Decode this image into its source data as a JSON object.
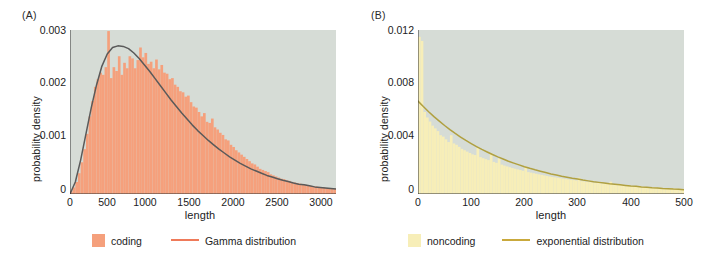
{
  "figure": {
    "background": "#ffffff",
    "plot_background": "#d6dcd6"
  },
  "panels": [
    {
      "tag": "(A)",
      "xlabel": "length",
      "ylabel": "probability density",
      "legend": {
        "hist_label": "coding",
        "curve_label": "Gamma distribution",
        "hist_color": "#f5a07c",
        "curve_color": "#ef7a5a"
      }
    },
    {
      "tag": "(B)",
      "xlabel": "length",
      "ylabel": "probability density",
      "legend": {
        "hist_label": "noncoding",
        "curve_label": "exponential distribution",
        "hist_color": "#f7eeb8",
        "curve_color": "#c9a93c"
      }
    }
  ],
  "chart_data": [
    {
      "type": "bar",
      "title": "(A)",
      "xlabel": "length",
      "ylabel": "probability density",
      "xlim": [
        0,
        3000
      ],
      "ylim": [
        0,
        0.003
      ],
      "xticks": [
        0,
        500,
        1000,
        1500,
        2000,
        2500,
        3000
      ],
      "xtick_labels": [
        "0",
        "500",
        "1000",
        "1500",
        "2000",
        "2500",
        "3000"
      ],
      "yticks": [
        0,
        0.001,
        0.002,
        0.003
      ],
      "ytick_labels": [
        "0",
        "0.001",
        "0.002",
        "0.003"
      ],
      "grid": false,
      "legend_position": "below",
      "plot_background": "#d6dcd6",
      "series": [
        {
          "name": "coding",
          "kind": "histogram",
          "color": "#f5a07c",
          "bin_width": 30,
          "bin_centers": [
            15,
            45,
            75,
            105,
            135,
            165,
            195,
            225,
            255,
            285,
            315,
            345,
            375,
            405,
            435,
            465,
            495,
            525,
            555,
            585,
            615,
            645,
            675,
            705,
            735,
            765,
            795,
            825,
            855,
            885,
            915,
            945,
            975,
            1005,
            1035,
            1065,
            1095,
            1125,
            1155,
            1185,
            1215,
            1245,
            1275,
            1305,
            1335,
            1365,
            1395,
            1425,
            1455,
            1485,
            1515,
            1545,
            1575,
            1605,
            1635,
            1665,
            1695,
            1725,
            1755,
            1785,
            1815,
            1845,
            1875,
            1905,
            1935,
            1965,
            1995,
            2025,
            2055,
            2085,
            2115,
            2145,
            2175,
            2205,
            2235,
            2265,
            2295,
            2325,
            2355,
            2385,
            2415,
            2445,
            2475,
            2505,
            2535,
            2565,
            2595,
            2625,
            2655,
            2685,
            2715,
            2745,
            2775,
            2805,
            2835,
            2865,
            2895,
            2925,
            2955,
            2985
          ],
          "values": [
            5e-05,
            0.00012,
            0.00022,
            0.00038,
            0.00058,
            0.00082,
            0.0011,
            0.00142,
            0.0017,
            0.00196,
            0.0021,
            0.00222,
            0.00218,
            0.00232,
            0.00298,
            0.00212,
            0.00232,
            0.00225,
            0.00252,
            0.00218,
            0.0024,
            0.0023,
            0.00252,
            0.00248,
            0.0023,
            0.00245,
            0.00268,
            0.0025,
            0.00258,
            0.00238,
            0.00242,
            0.0023,
            0.00246,
            0.00228,
            0.00236,
            0.00222,
            0.0022,
            0.0021,
            0.00212,
            0.002,
            0.00196,
            0.00188,
            0.00186,
            0.00178,
            0.0018,
            0.00168,
            0.0016,
            0.00158,
            0.0015,
            0.00142,
            0.00148,
            0.00132,
            0.0013,
            0.00138,
            0.00122,
            0.00118,
            0.00112,
            0.00108,
            0.001,
            0.00098,
            0.0009,
            0.00086,
            0.0008,
            0.00076,
            0.00072,
            0.00068,
            0.00064,
            0.0006,
            0.00056,
            0.00054,
            0.0005,
            0.00046,
            0.00044,
            0.00042,
            0.0004,
            0.00036,
            0.00034,
            0.00032,
            0.0003,
            0.00028,
            0.00027,
            0.00025,
            0.00024,
            0.00022,
            0.00021,
            0.0002,
            0.00019,
            0.00018,
            0.00017,
            0.00016,
            0.00015,
            0.00014,
            0.00014,
            0.00013,
            0.00012,
            0.00012,
            0.00011,
            0.00011,
            0.0001,
            0.0001
          ]
        },
        {
          "name": "Gamma distribution",
          "kind": "line",
          "color": "#5a5a5a",
          "x": [
            0,
            60,
            120,
            180,
            240,
            300,
            360,
            420,
            480,
            540,
            600,
            660,
            720,
            780,
            840,
            900,
            960,
            1020,
            1080,
            1140,
            1200,
            1260,
            1320,
            1380,
            1440,
            1500,
            1560,
            1620,
            1680,
            1740,
            1800,
            1860,
            1920,
            1980,
            2040,
            2100,
            2160,
            2220,
            2280,
            2340,
            2400,
            2460,
            2520,
            2580,
            2640,
            2700,
            2760,
            2820,
            2880,
            2940,
            3000
          ],
          "y": [
            0.0,
            0.00022,
            0.00062,
            0.0011,
            0.00158,
            0.002,
            0.00234,
            0.00256,
            0.00268,
            0.00271,
            0.0027,
            0.00266,
            0.00258,
            0.00248,
            0.00236,
            0.00224,
            0.00211,
            0.00198,
            0.00185,
            0.00172,
            0.0016,
            0.00148,
            0.00137,
            0.00126,
            0.00116,
            0.00107,
            0.00098,
            0.0009,
            0.00082,
            0.00075,
            0.00068,
            0.00062,
            0.00056,
            0.00051,
            0.00046,
            0.00042,
            0.00038,
            0.00034,
            0.00031,
            0.00028,
            0.00025,
            0.00023,
            0.0002,
            0.00018,
            0.00017,
            0.00015,
            0.00013,
            0.00012,
            0.00011,
            0.0001,
            9e-05
          ]
        }
      ]
    },
    {
      "type": "bar",
      "title": "(B)",
      "xlabel": "length",
      "ylabel": "probability density",
      "xlim": [
        0,
        500
      ],
      "ylim": [
        0,
        0.012
      ],
      "xticks": [
        0,
        100,
        200,
        300,
        400,
        500
      ],
      "xtick_labels": [
        "0",
        "100",
        "200",
        "300",
        "400",
        "500"
      ],
      "yticks": [
        0,
        0.004,
        0.008,
        0.012
      ],
      "ytick_labels": [
        "0",
        "0.004",
        "0.008",
        "0.012"
      ],
      "grid": false,
      "legend_position": "below",
      "plot_background": "#d6dcd6",
      "series": [
        {
          "name": "noncoding",
          "kind": "histogram",
          "color": "#f7eeb8",
          "bin_width": 5,
          "bin_centers": [
            2.5,
            7.5,
            12.5,
            17.5,
            22.5,
            27.5,
            32.5,
            37.5,
            42.5,
            47.5,
            52.5,
            57.5,
            62.5,
            67.5,
            72.5,
            77.5,
            82.5,
            87.5,
            92.5,
            97.5,
            102.5,
            107.5,
            112.5,
            117.5,
            122.5,
            127.5,
            132.5,
            137.5,
            142.5,
            147.5,
            152.5,
            157.5,
            162.5,
            167.5,
            172.5,
            177.5,
            182.5,
            187.5,
            192.5,
            197.5,
            202.5,
            207.5,
            212.5,
            217.5,
            222.5,
            227.5,
            232.5,
            237.5,
            242.5,
            247.5,
            252.5,
            257.5,
            262.5,
            267.5,
            272.5,
            277.5,
            282.5,
            287.5,
            292.5,
            297.5,
            302.5,
            307.5,
            312.5,
            317.5,
            322.5,
            327.5,
            332.5,
            337.5,
            342.5,
            347.5,
            352.5,
            357.5,
            362.5,
            367.5,
            372.5,
            377.5,
            382.5,
            387.5,
            392.5,
            397.5,
            402.5,
            407.5,
            412.5,
            417.5,
            422.5,
            427.5,
            432.5,
            437.5,
            442.5,
            447.5,
            452.5,
            457.5,
            462.5,
            467.5,
            472.5,
            477.5,
            482.5,
            487.5,
            492.5,
            497.5
          ],
          "values": [
            0.0115,
            0.0112,
            0.006,
            0.0056,
            0.0053,
            0.005,
            0.0048,
            0.0046,
            0.0043,
            0.0042,
            0.004,
            0.0038,
            0.0043,
            0.0037,
            0.0036,
            0.00345,
            0.0033,
            0.0032,
            0.0031,
            0.003,
            0.0029,
            0.00285,
            0.0034,
            0.0027,
            0.00262,
            0.00255,
            0.00248,
            0.003,
            0.00235,
            0.00228,
            0.0026,
            0.00215,
            0.00208,
            0.00202,
            0.00196,
            0.0019,
            0.00185,
            0.0018,
            0.00175,
            0.0017,
            0.002,
            0.0016,
            0.00156,
            0.00152,
            0.00148,
            0.00144,
            0.0014,
            0.00136,
            0.00132,
            0.00128,
            0.00125,
            0.00122,
            0.00119,
            0.00116,
            0.00113,
            0.0011,
            0.00107,
            0.00104,
            0.00102,
            0.00099,
            0.0012,
            0.00094,
            0.00092,
            0.00089,
            0.00087,
            0.00085,
            0.00083,
            0.00081,
            0.00079,
            0.00077,
            0.00075,
            0.00073,
            0.0009,
            0.0007,
            0.00068,
            0.00066,
            0.00065,
            0.00063,
            0.00062,
            0.0006,
            0.00059,
            0.00057,
            0.00056,
            0.00055,
            0.00053,
            0.00052,
            0.00051,
            0.0005,
            0.00048,
            0.00047,
            0.00046,
            0.00045,
            0.00044,
            0.00043,
            0.00042,
            0.00041,
            0.0004,
            0.00039,
            0.00038,
            0.00037
          ]
        },
        {
          "name": "exponential distribution",
          "kind": "line",
          "color": "#b0a040",
          "x": [
            0,
            10,
            20,
            30,
            40,
            50,
            60,
            70,
            80,
            90,
            100,
            110,
            120,
            130,
            140,
            150,
            160,
            170,
            180,
            190,
            200,
            210,
            220,
            230,
            240,
            250,
            260,
            270,
            280,
            290,
            300,
            310,
            320,
            330,
            340,
            350,
            360,
            370,
            380,
            390,
            400,
            410,
            420,
            430,
            440,
            450,
            460,
            470,
            480,
            490,
            500
          ],
          "y": [
            0.0068,
            0.0064,
            0.00602,
            0.00566,
            0.00533,
            0.00501,
            0.00471,
            0.00443,
            0.00417,
            0.00392,
            0.00369,
            0.00347,
            0.00326,
            0.00307,
            0.00289,
            0.00272,
            0.00256,
            0.0024,
            0.00226,
            0.00213,
            0.002,
            0.00188,
            0.00177,
            0.00167,
            0.00157,
            0.00147,
            0.00139,
            0.0013,
            0.00123,
            0.00115,
            0.00109,
            0.00102,
            0.00096,
            0.0009,
            0.00085,
            0.0008,
            0.00075,
            0.00071,
            0.00067,
            0.00063,
            0.00059,
            0.00056,
            0.00052,
            0.00049,
            0.00046,
            0.00044,
            0.00041,
            0.00039,
            0.00036,
            0.00034,
            0.00032
          ]
        }
      ]
    }
  ]
}
